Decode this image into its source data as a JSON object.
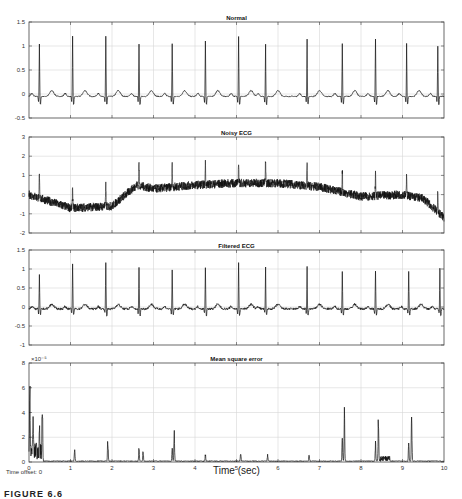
{
  "chart_data": [
    {
      "type": "line",
      "title": "Normal",
      "xlabel": "",
      "ylabel": "",
      "xlim": [
        0,
        10
      ],
      "ylim": [
        -0.5,
        1.5
      ],
      "yticks": [
        "1.5",
        "1",
        "0.5",
        "0",
        "-0.5"
      ],
      "grid": true,
      "series": [
        {
          "name": "Normal ECG",
          "r_peak_times": [
            0.25,
            1.05,
            1.85,
            2.65,
            3.45,
            4.25,
            5.05,
            5.7,
            6.7,
            7.55,
            8.35,
            9.1,
            9.85
          ],
          "r_peak_values": [
            1.1,
            1.25,
            1.25,
            1.1,
            1.1,
            1.15,
            1.25,
            1.1,
            1.2,
            1.1,
            1.2,
            1.1,
            1.05
          ],
          "baseline": 0
        }
      ]
    },
    {
      "type": "line",
      "title": "Noisy ECG",
      "xlim": [
        0,
        10
      ],
      "ylim": [
        -2,
        3
      ],
      "yticks": [
        "3",
        "2",
        "1",
        "0",
        "-1",
        "-2"
      ],
      "grid": true,
      "series": [
        {
          "name": "Noisy ECG",
          "baseline_x": [
            0,
            1,
            2,
            2.6,
            3,
            4,
            5,
            6,
            7,
            8,
            9,
            9.5,
            10
          ],
          "baseline_y": [
            0,
            -0.7,
            -0.6,
            0.5,
            0.3,
            0.5,
            0.6,
            0.6,
            0.4,
            -0.1,
            0.0,
            -0.2,
            -1.2
          ]
        }
      ]
    },
    {
      "type": "line",
      "title": "Filtered ECG",
      "xlim": [
        0,
        10
      ],
      "ylim": [
        -1,
        1.5
      ],
      "yticks": [
        "1.5",
        "1",
        "0.5",
        "0",
        "-0.5",
        "-1"
      ],
      "grid": true,
      "series": [
        {
          "name": "Filtered ECG",
          "r_peak_times": [
            0.25,
            1.05,
            1.85,
            2.65,
            3.45,
            4.25,
            5.05,
            5.7,
            6.7,
            7.55,
            8.35,
            9.15,
            9.9
          ],
          "r_peak_values": [
            0.9,
            1.2,
            1.25,
            1.1,
            1.0,
            1.1,
            1.2,
            1.1,
            1.1,
            1.0,
            1.0,
            1.0,
            1.05
          ],
          "baseline": 0
        }
      ]
    },
    {
      "type": "line",
      "title": "Mean square error",
      "xlabel": "Time (sec)",
      "xlim": [
        0,
        10
      ],
      "ylim": [
        0,
        8
      ],
      "y_multiplier": "×10^-5",
      "yticks": [
        "8",
        "6",
        "4",
        "2",
        "0"
      ],
      "xticks": [
        "0",
        "1",
        "2",
        "3",
        "4",
        "5",
        "6",
        "7",
        "8",
        "9",
        "10"
      ],
      "grid": true,
      "series": [
        {
          "name": "MSE",
          "spike_times": [
            0.02,
            0.1,
            0.25,
            0.32,
            1.1,
            1.9,
            2.65,
            2.75,
            3.45,
            3.5,
            4.25,
            5.1,
            5.75,
            6.75,
            7.55,
            7.6,
            8.35,
            8.42,
            9.15,
            9.22
          ],
          "spike_values": [
            6.2,
            2.8,
            3.2,
            5.0,
            1.2,
            2.1,
            1.3,
            1.0,
            1.3,
            2.6,
            0.7,
            0.8,
            0.6,
            0.7,
            2.3,
            4.9,
            1.8,
            4.2,
            2.0,
            4.8
          ]
        }
      ]
    }
  ],
  "labels": {
    "panel1_title": "Normal",
    "panel2_title": "Noisy ECG",
    "panel3_title": "Filtered ECG",
    "panel4_title": "Mean square error",
    "xlabel": "Time (sec)",
    "time_offset": "Time offset:  0",
    "exponent": "×10⁻⁵",
    "figure_caption": "FIGURE 6.6"
  }
}
